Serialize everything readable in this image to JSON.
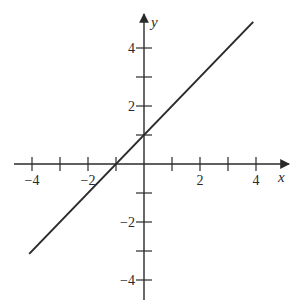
{
  "chart_data": {
    "type": "line",
    "title": "",
    "xlabel": "x",
    "ylabel": "y",
    "xlim": [
      -4.1,
      5.1
    ],
    "ylim": [
      -4.7,
      5.0
    ],
    "grid": false,
    "legend": null,
    "x_ticks": [
      -4,
      -3,
      -2,
      -1,
      1,
      2,
      3,
      4
    ],
    "x_tick_labels": [
      {
        "value": -4,
        "label": "−4"
      },
      {
        "value": -2,
        "label": "−2"
      },
      {
        "value": 2,
        "label": "2"
      },
      {
        "value": 4,
        "label": "4"
      }
    ],
    "y_ticks": [
      -4,
      -3,
      -2,
      -1,
      1,
      2,
      3,
      4
    ],
    "y_tick_labels": [
      {
        "value": 4,
        "label": "4"
      },
      {
        "value": 2,
        "label": "2"
      },
      {
        "value": -2,
        "label": "−2"
      },
      {
        "value": -4,
        "label": "−4"
      }
    ],
    "series": [
      {
        "name": "y = x + 1",
        "equation": "y = x + 1",
        "slope": 1,
        "intercept": 1,
        "x": [
          -4.1,
          3.9
        ],
        "y": [
          -3.1,
          4.9
        ],
        "color": "#2a2a2a"
      }
    ],
    "annotations": {
      "x_intercept": -1,
      "y_intercept": 1
    }
  },
  "axes": {
    "x_label": "x",
    "y_label": "y",
    "color": "#2a2a2a"
  }
}
